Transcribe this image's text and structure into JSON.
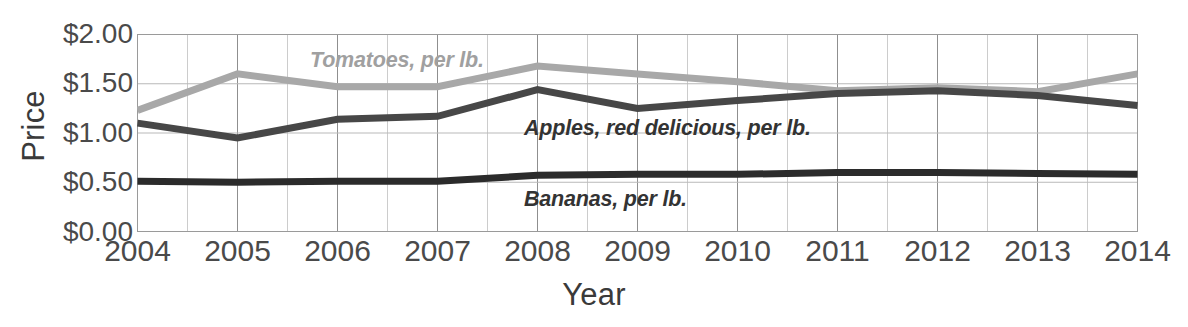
{
  "chart_data": {
    "type": "line",
    "title": "",
    "xlabel": "Year",
    "ylabel": "Price",
    "x": [
      2004,
      2005,
      2006,
      2007,
      2008,
      2009,
      2010,
      2011,
      2012,
      2013,
      2014
    ],
    "xtick_labels": [
      "2004",
      "2005",
      "2006",
      "2007",
      "2008",
      "2009",
      "2010",
      "2011",
      "2012",
      "2013",
      "2014"
    ],
    "ytick_labels": [
      "$2.00",
      "$1.50",
      "$1.00",
      "$0.50",
      "$0.00"
    ],
    "ytick_values": [
      2.0,
      1.5,
      1.0,
      0.5,
      0.0
    ],
    "ylim": [
      0,
      2.0
    ],
    "xlim": [
      2004,
      2014
    ],
    "grid": "both-major-and-minor",
    "legend_position": "inline-labels",
    "series": [
      {
        "name": "Tomatoes, per lb.",
        "label": "Tomatoes, per lb.",
        "color": "#a8a8a8",
        "values": [
          1.23,
          1.6,
          1.47,
          1.47,
          1.68,
          1.6,
          1.52,
          1.43,
          1.46,
          1.42,
          1.6
        ]
      },
      {
        "name": "Apples, red delicious, per lb.",
        "label": "Apples, red delicious, per lb.",
        "color": "#474747",
        "values": [
          1.1,
          0.95,
          1.14,
          1.17,
          1.44,
          1.25,
          1.33,
          1.4,
          1.43,
          1.38,
          1.28
        ]
      },
      {
        "name": "Bananas, per lb.",
        "label": "Bananas, per lb.",
        "color": "#2b2b2b",
        "values": [
          0.51,
          0.5,
          0.51,
          0.51,
          0.57,
          0.58,
          0.58,
          0.6,
          0.6,
          0.59,
          0.58
        ]
      }
    ]
  }
}
